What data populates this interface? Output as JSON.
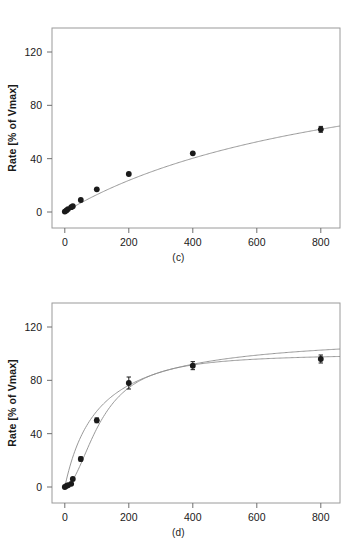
{
  "figure": {
    "panels": [
      {
        "id": "c",
        "caption": "(c)",
        "chart_data": {
          "type": "scatter",
          "title": "",
          "xlabel": "Substrate concentration [micromolar]",
          "ylabel": "Rate [% of Vmax]",
          "xlim": [
            -40,
            860
          ],
          "ylim": [
            -12,
            138
          ],
          "xticks": [
            0,
            200,
            400,
            600,
            800
          ],
          "yticks": [
            0,
            40,
            80,
            120
          ],
          "grid": false,
          "legend": "none",
          "series": [
            {
              "name": "Measured rate",
              "marker": "filled-circle",
              "color": "#1a1a1a",
              "x": [
                0,
                5,
                10,
                20,
                25,
                50,
                100,
                200,
                400,
                800
              ],
              "y": [
                0.3,
                1.2,
                2.2,
                3.6,
                4.3,
                9.0,
                17.0,
                28.5,
                44.0,
                62.0
              ],
              "yerr": [
                0.5,
                0.5,
                0.5,
                0.5,
                0.5,
                0.6,
                0.8,
                1.0,
                1.2,
                2.2
              ]
            },
            {
              "name": "Michaelis-Menten fit",
              "marker": "none",
              "line": "solid",
              "color": "#8c8c8c",
              "fit": "hyperbolic",
              "vmax_percent": 135,
              "km": 940
            }
          ]
        }
      },
      {
        "id": "d",
        "caption": "(d)",
        "chart_data": {
          "type": "scatter",
          "title": "",
          "xlabel": "Substrate concentration [micromolar]",
          "ylabel": "Rate [% of Vmax]",
          "xlim": [
            -40,
            860
          ],
          "ylim": [
            -12,
            138
          ],
          "xticks": [
            0,
            200,
            400,
            600,
            800
          ],
          "yticks": [
            0,
            40,
            80,
            120
          ],
          "grid": false,
          "legend": "none",
          "series": [
            {
              "name": "Measured rate",
              "marker": "filled-circle",
              "color": "#1a1a1a",
              "x": [
                0,
                5,
                10,
                20,
                25,
                50,
                100,
                200,
                400,
                800
              ],
              "y": [
                0.0,
                0.8,
                1.4,
                2.4,
                6.0,
                21.0,
                50.0,
                78.0,
                91.0,
                96.0
              ],
              "yerr": [
                1.0,
                1.0,
                1.0,
                1.0,
                1.2,
                1.5,
                1.8,
                4.5,
                3.0,
                3.0
              ]
            },
            {
              "name": "Hyperbolic fit",
              "marker": "none",
              "line": "solid",
              "color": "#8c8c8c",
              "fit": "hyperbolic",
              "vmax_percent": 116,
              "km": 104
            },
            {
              "name": "Sigmoidal fit",
              "marker": "none",
              "line": "solid",
              "color": "#8c8c8c",
              "fit": "sigmoidal",
              "vmax_percent": 100,
              "k_half": 114,
              "hill_n": 1.9
            }
          ],
          "annotations": [
            {
              "text": "curves intersect",
              "x": 480,
              "y": 93
            }
          ]
        }
      }
    ]
  }
}
